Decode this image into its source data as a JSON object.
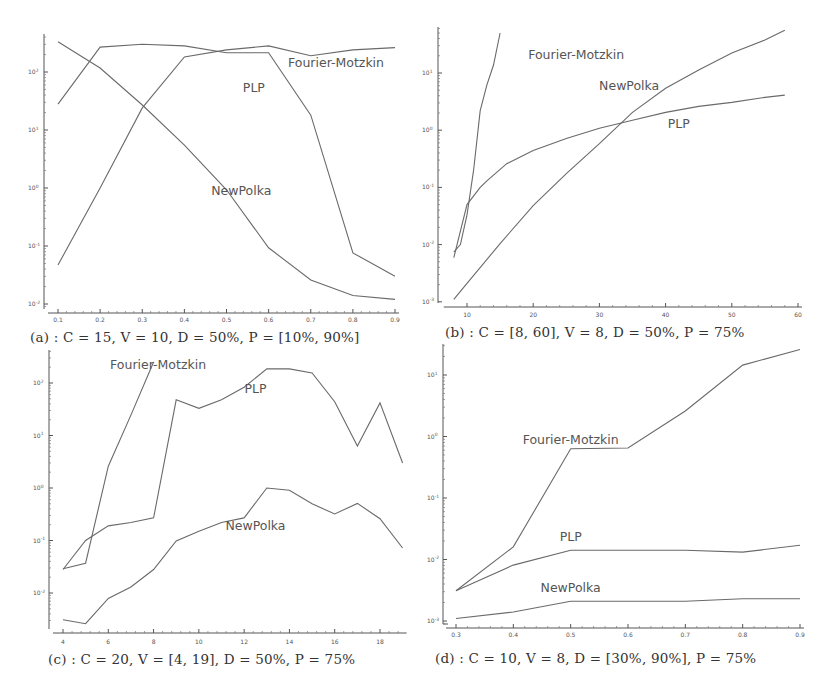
{
  "figure": {
    "series_names": [
      "Fourier-Motzkin",
      "PLP",
      "NewPolka"
    ]
  },
  "chart_data": [
    {
      "id": "a",
      "type": "line",
      "yscale": "log",
      "caption": "(a) : C = 15, V = 10, D = 50%, P = [10%, 90%]",
      "xlabel": "",
      "ylabel": "",
      "xlim": [
        0.1,
        0.9
      ],
      "ylim_log10": [
        -2,
        2.55
      ],
      "x_ticks": [
        "0.1",
        "0.2",
        "0.3",
        "0.4",
        "0.5",
        "0.6",
        "0.7",
        "0.8",
        "0.9"
      ],
      "y_ticks": [
        "10^-2",
        "10^-1",
        "10^0",
        "10^1",
        "10^2"
      ],
      "x": [
        0.1,
        0.2,
        0.3,
        0.4,
        0.5,
        0.6,
        0.7,
        0.8,
        0.9
      ],
      "series": [
        {
          "name": "Fourier-Motzkin",
          "values": [
            0.047,
            1.0,
            24,
            182,
            240,
            282,
            190,
            240,
            263
          ]
        },
        {
          "name": "PLP",
          "values": [
            28,
            269,
            302,
            282,
            214,
            214,
            18,
            0.076,
            0.03
          ]
        },
        {
          "name": "NewPolka",
          "values": [
            331,
            117,
            27,
            5.5,
            0.93,
            0.093,
            0.026,
            0.014,
            0.012
          ]
        }
      ],
      "labels": [
        {
          "text": "Fourier-Motzkin",
          "x": 0.76,
          "ylog": 2.15
        },
        {
          "text": "PLP",
          "x": 0.565,
          "ylog": 1.72
        },
        {
          "text": "NewPolka",
          "x": 0.535,
          "ylog": -0.05
        }
      ]
    },
    {
      "id": "b",
      "type": "line",
      "yscale": "log",
      "caption": "(b) : C = [8, 60], V = 8, D = 50%, P = 75%",
      "xlabel": "",
      "ylabel": "",
      "xlim": [
        8,
        60
      ],
      "ylim_log10": [
        -3,
        1.7
      ],
      "x_ticks": [
        "10",
        "20",
        "30",
        "40",
        "50",
        "60"
      ],
      "y_ticks": [
        "10^-3",
        "10^-2",
        "10^-1",
        "10^0",
        "10^1"
      ],
      "series": [
        {
          "name": "Fourier-Motzkin",
          "x": [
            8,
            9,
            10,
            11,
            12,
            13,
            14,
            15
          ],
          "values": [
            0.0074,
            0.01,
            0.033,
            0.2,
            2.2,
            6.2,
            13.8,
            50
          ]
        },
        {
          "name": "PLP",
          "x": [
            8,
            10,
            12,
            13,
            16,
            20,
            25,
            30,
            35,
            40,
            45,
            50,
            55,
            58
          ],
          "values": [
            0.0059,
            0.05,
            0.1,
            0.13,
            0.26,
            0.44,
            0.72,
            1.08,
            1.49,
            2.05,
            2.61,
            3.06,
            3.75,
            4.1
          ]
        },
        {
          "name": "NewPolka",
          "x": [
            8,
            10,
            15,
            20,
            25,
            30,
            35,
            40,
            45,
            50,
            55,
            58
          ],
          "values": [
            0.0011,
            0.0021,
            0.0104,
            0.048,
            0.174,
            0.58,
            2.05,
            5.4,
            11.3,
            22.4,
            37.8,
            56
          ]
        }
      ],
      "labels": [
        {
          "text": "Fourier-Motzkin",
          "x": 26.5,
          "ylog": 1.32
        },
        {
          "text": "NewPolka",
          "x": 34.5,
          "ylog": 0.78
        },
        {
          "text": "PLP",
          "x": 42,
          "ylog": 0.1
        }
      ]
    },
    {
      "id": "c",
      "type": "line",
      "yscale": "log",
      "caption": "(c) : C = 20, V = [4, 19], D = 50%, P = 75%",
      "xlabel": "",
      "ylabel": "",
      "xlim": [
        4,
        19
      ],
      "ylim_log10": [
        -2.7,
        2.45
      ],
      "x_ticks": [
        "4",
        "6",
        "8",
        "10",
        "12",
        "14",
        "16",
        "18"
      ],
      "y_ticks": [
        "10^-2",
        "10^-1",
        "10^0",
        "10^1",
        "10^2"
      ],
      "series": [
        {
          "name": "Fourier-Motzkin",
          "x": [
            4,
            5,
            6,
            7,
            8
          ],
          "values": [
            0.029,
            0.037,
            2.6,
            24.5,
            251
          ]
        },
        {
          "name": "PLP",
          "x": [
            4,
            5,
            6,
            7,
            8,
            9,
            10,
            11,
            12,
            13,
            14,
            15,
            16,
            17,
            18,
            19
          ],
          "values": [
            0.028,
            0.1,
            0.19,
            0.22,
            0.27,
            47.9,
            33,
            48,
            83,
            186,
            186,
            155,
            44,
            6.3,
            41.7,
            3.0
          ]
        },
        {
          "name": "NewPolka",
          "x": [
            4,
            5,
            6,
            7,
            8,
            9,
            10,
            11,
            12,
            13,
            14,
            15,
            16,
            17,
            18,
            19
          ],
          "values": [
            0.0031,
            0.0026,
            0.0079,
            0.013,
            0.028,
            0.098,
            0.15,
            0.22,
            0.27,
            1.0,
            0.91,
            0.5,
            0.32,
            0.51,
            0.26,
            0.072
          ]
        }
      ],
      "labels": [
        {
          "text": "Fourier-Motzkin",
          "x": 8.2,
          "ylog": 2.35
        },
        {
          "text": "PLP",
          "x": 12.5,
          "ylog": 1.88
        },
        {
          "text": "NewPolka",
          "x": 12.5,
          "ylog": -0.72
        }
      ]
    },
    {
      "id": "d",
      "type": "line",
      "yscale": "log",
      "caption": "(d) : C = 10, V = 8, D = [30%, 90%], P = 75%",
      "xlabel": "",
      "ylabel": "",
      "xlim": [
        0.3,
        0.9
      ],
      "ylim_log10": [
        -3,
        1.45
      ],
      "x_ticks": [
        "0.3",
        "0.4",
        "0.5",
        "0.6",
        "0.7",
        "0.8",
        "0.9"
      ],
      "y_ticks": [
        "10^-3",
        "10^-2",
        "10^-1",
        "10^0",
        "10^1"
      ],
      "x": [
        0.3,
        0.4,
        0.5,
        0.6,
        0.7,
        0.8,
        0.9
      ],
      "series": [
        {
          "name": "Fourier-Motzkin",
          "values": [
            0.0031,
            0.016,
            0.63,
            0.65,
            2.6,
            14.5,
            26
          ]
        },
        {
          "name": "PLP",
          "values": [
            0.0031,
            0.0081,
            0.0141,
            0.0141,
            0.0141,
            0.0132,
            0.017
          ]
        },
        {
          "name": "NewPolka",
          "values": [
            0.0011,
            0.0014,
            0.0021,
            0.0021,
            0.0021,
            0.0023,
            0.0023
          ]
        }
      ],
      "labels": [
        {
          "text": "Fourier-Motzkin",
          "x": 0.5,
          "ylog": -0.05
        },
        {
          "text": "PLP",
          "x": 0.5,
          "ylog": -1.63
        },
        {
          "text": "NewPolka",
          "x": 0.5,
          "ylog": -2.47
        }
      ]
    }
  ]
}
